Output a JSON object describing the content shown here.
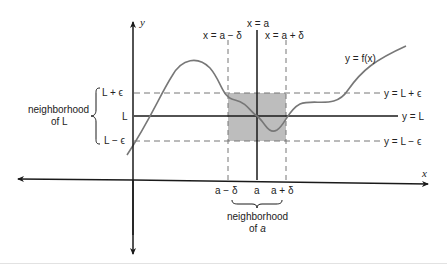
{
  "diagram": {
    "axes": {
      "x_label": "x",
      "y_label": "y"
    },
    "curve_label": "y = f(x)",
    "vertical_lines": {
      "center": "x = a",
      "left": "x = a − δ",
      "right": "x = a + δ"
    },
    "horizontal_lines": {
      "upper": "y = L + ϵ",
      "middle": "y = L",
      "lower": "y = L − ϵ"
    },
    "y_ticks": {
      "upper": "L + ϵ",
      "middle": "L",
      "lower": "L − ϵ"
    },
    "x_ticks": {
      "left": "a − δ",
      "center": "a",
      "right": "a + δ"
    },
    "neighborhood_L": {
      "line1": "neighborhood",
      "line2": "of L"
    },
    "neighborhood_a": {
      "line1": "neighborhood",
      "line2_prefix": "of ",
      "line2_var": "a"
    },
    "colors": {
      "axis": "#1a1a1a",
      "curve": "#777777",
      "dash": "#777777",
      "shade": "#bdbdbd"
    }
  }
}
